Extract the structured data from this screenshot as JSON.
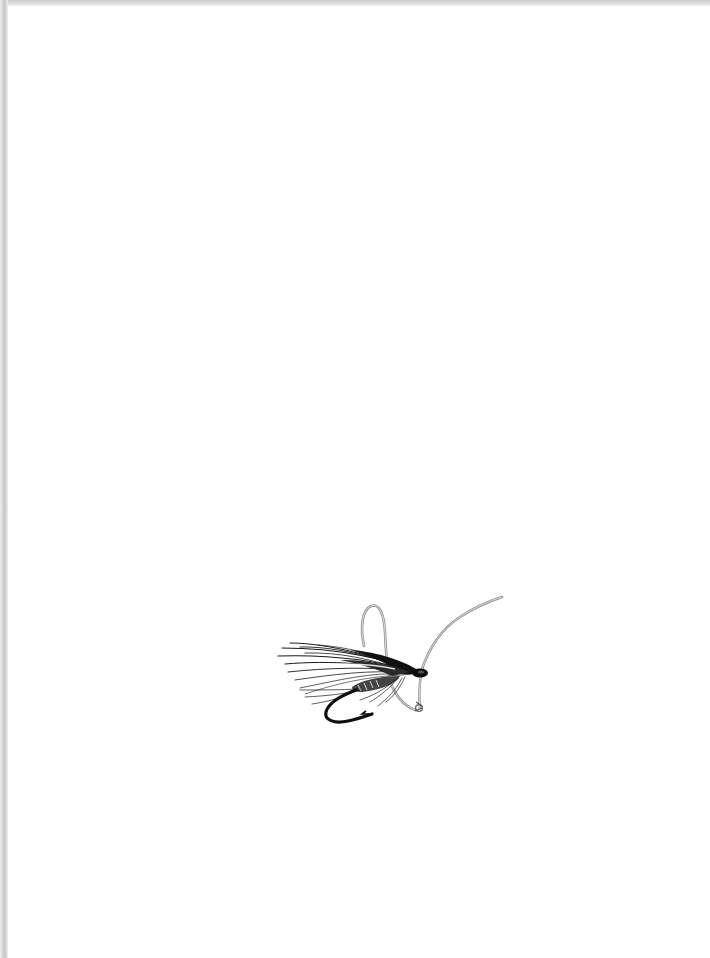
{
  "page": {
    "type": "scanned book page",
    "background": "#ffffff",
    "edge_shadow_color": "#cfcfcf"
  },
  "illustration": {
    "subject": "fishing-fly-icon",
    "description": "Wet fishing fly with feathered wing, tied to a hook, with a gut leader loop",
    "ink_color": "#111111",
    "leader_color": "#9a9a9a"
  },
  "text": {
    "visible_text": ""
  }
}
